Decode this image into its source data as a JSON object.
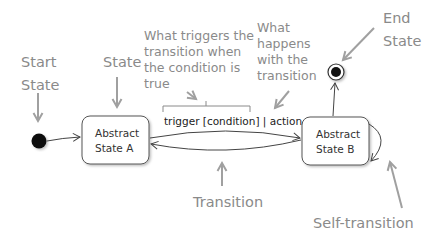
{
  "diagram": {
    "type": "UML state machine diagram",
    "annotations": {
      "start_state": [
        "Start",
        "State"
      ],
      "state": "State",
      "trigger_note": [
        "What triggers the",
        "transition when",
        "the condition is",
        "true"
      ],
      "action_note": [
        "What",
        "happens",
        "with the",
        "transition"
      ],
      "end_state": [
        "End",
        "State"
      ],
      "transition": "Transition",
      "self_transition": "Self-transition"
    },
    "states": [
      {
        "id": "A",
        "label": [
          "Abstract",
          "State A"
        ]
      },
      {
        "id": "B",
        "label": [
          "Abstract",
          "State B"
        ]
      }
    ],
    "transition_label": "trigger [condition] | action",
    "edges": [
      {
        "from": "start",
        "to": "A"
      },
      {
        "from": "A",
        "to": "B",
        "label": "trigger [condition] | action"
      },
      {
        "from": "B",
        "to": "A"
      },
      {
        "from": "B",
        "to": "B",
        "kind": "self-transition"
      },
      {
        "from": "B",
        "to": "end"
      }
    ],
    "colors": {
      "annotation": "#8a8a8a",
      "annotation_arrow": "#a0a0a0",
      "node_stroke": "#555555",
      "node_fill": "#ffffff",
      "pseudostate": "#111111"
    }
  }
}
